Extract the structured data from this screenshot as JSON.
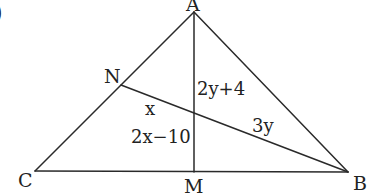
{
  "corner_label": ")",
  "vertices": {
    "A": {
      "label": "A",
      "x": 194,
      "y": 12
    },
    "B": {
      "label": "B",
      "x": 348,
      "y": 172
    },
    "C": {
      "label": "C",
      "x": 35,
      "y": 171
    },
    "M": {
      "label": "M",
      "x": 194,
      "y": 172
    },
    "N": {
      "label": "N",
      "x": 121,
      "y": 85
    }
  },
  "segments": [
    {
      "from": "A",
      "to": "C"
    },
    {
      "from": "A",
      "to": "B"
    },
    {
      "from": "C",
      "to": "B"
    },
    {
      "from": "A",
      "to": "M"
    },
    {
      "from": "N",
      "to": "B"
    }
  ],
  "segment_labels": {
    "upper_AM": "2y+4",
    "lower_AM": "2x−10",
    "N_to_intersection": "x",
    "intersection_to_B": "3y"
  },
  "colors": {
    "stroke": "#2a2a2a",
    "text": "#222222",
    "background": "#ffffff"
  }
}
